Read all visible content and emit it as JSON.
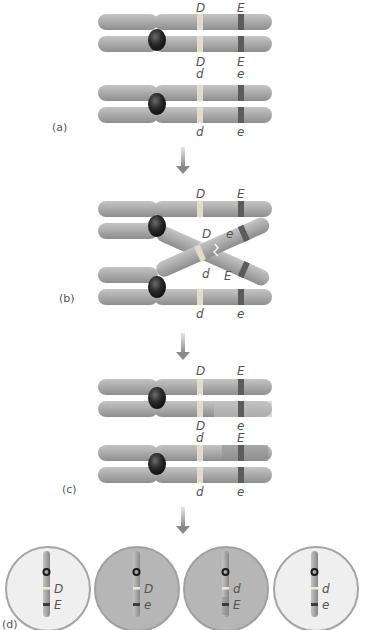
{
  "figure": {
    "colors": {
      "background": "#ffffff",
      "chromosome_body": "#a9a9a9",
      "chromosome_highlight": "#c8c8c8",
      "centromere": "#1e1e1e",
      "band_D": "#dcdcc8",
      "band_E": "#5a5a5a",
      "arrow": "#8a8a8a",
      "label_text": "#555555",
      "cell_light": "#efefef",
      "cell_dark": "#b4b4b4",
      "cell_border": "#9a9a9a"
    }
  },
  "panels": {
    "a": {
      "label": "(a)",
      "top_pair": {
        "upper_labels": [
          "D",
          "E"
        ],
        "lower_labels": [
          "D",
          "E"
        ]
      },
      "bottom_pair": {
        "upper_labels": [
          "d",
          "e"
        ],
        "lower_labels": [
          "d",
          "e"
        ]
      }
    },
    "b": {
      "label": "(b)",
      "top_labels": [
        "D",
        "E"
      ],
      "crossover_labels": {
        "upper": [
          "D",
          "e"
        ],
        "lower": [
          "d",
          "E"
        ]
      },
      "bottom_labels": [
        "d",
        "e"
      ]
    },
    "c": {
      "label": "(c)",
      "top_pair": {
        "upper_labels": [
          "D",
          "E"
        ],
        "lower_labels": [
          "D",
          "e"
        ]
      },
      "bottom_pair": {
        "upper_labels": [
          "d",
          "E"
        ],
        "lower_labels": [
          "d",
          "e"
        ]
      }
    },
    "d": {
      "label": "(d)",
      "cells": [
        {
          "allele1": "D",
          "allele2": "E",
          "shade": "light"
        },
        {
          "allele1": "D",
          "allele2": "e",
          "shade": "dark"
        },
        {
          "allele1": "d",
          "allele2": "E",
          "shade": "dark"
        },
        {
          "allele1": "d",
          "allele2": "e",
          "shade": "light"
        }
      ]
    }
  },
  "arrows": [
    "a-to-b",
    "b-to-c",
    "c-to-d"
  ]
}
